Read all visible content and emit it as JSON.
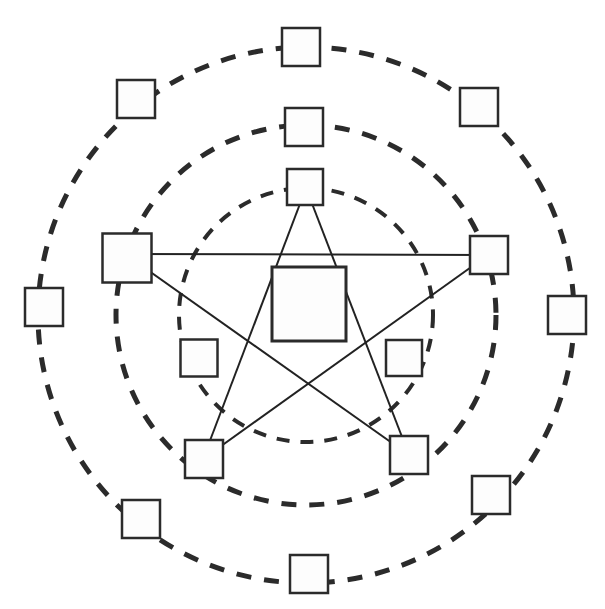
{
  "diagram": {
    "type": "node-link-diagram",
    "canvas": {
      "width": 605,
      "height": 609,
      "background": "#ffffff"
    },
    "center": {
      "x": 306,
      "y": 315
    },
    "colors": {
      "stroke": "#1a1a1a",
      "ring_stroke": "#2b2b2b",
      "node_fill": "#fdfdfd",
      "node_stroke": "#2b2b2b",
      "star_stroke": "#222222",
      "background": "#ffffff"
    },
    "rings": [
      {
        "id": "outer-ring",
        "name": "outer-ring",
        "radius": 268,
        "stroke_width": 5,
        "dash_pattern": "15 13",
        "node_count": 10,
        "node_size": 38,
        "start_angle_deg": -90,
        "style": "dashed"
      },
      {
        "id": "middle-ring",
        "name": "middle-ring",
        "radius": 190,
        "stroke_width": 5,
        "dash_pattern": "15 13",
        "node_count": 5,
        "node_size": 38,
        "start_angle_deg": -90,
        "style": "dashed"
      },
      {
        "id": "inner-ring",
        "name": "inner-ring",
        "radius": 127,
        "stroke_width": 4,
        "dash_pattern": "13 11",
        "node_count": 3,
        "node_size": 36,
        "start_angle_deg": -90,
        "style": "dashed"
      }
    ],
    "center_node": {
      "id": "center-node",
      "name": "center-node",
      "x": 309,
      "y": 304,
      "size": 74,
      "stroke_width": 3
    },
    "star": {
      "id": "pentagram",
      "name": "pentagram",
      "points": 5,
      "skip": 2,
      "stroke_width": 2,
      "vertices": [
        {
          "label": "top",
          "x": 306,
          "y": 188
        },
        {
          "label": "right",
          "x": 488,
          "y": 255
        },
        {
          "label": "bottom-right",
          "x": 409,
          "y": 455
        },
        {
          "label": "bottom-left",
          "x": 203,
          "y": 459
        },
        {
          "label": "left",
          "x": 125,
          "y": 254
        }
      ],
      "edges": [
        [
          0,
          2
        ],
        [
          2,
          4
        ],
        [
          4,
          1
        ],
        [
          1,
          3
        ],
        [
          3,
          0
        ]
      ]
    },
    "nodes": [
      {
        "id": "outer-1",
        "ring": "outer-ring",
        "name": "outer-node-n",
        "cx": 301,
        "cy": 47,
        "size": 38
      },
      {
        "id": "outer-2",
        "ring": "outer-ring",
        "name": "outer-node-nne",
        "cx": 479,
        "cy": 107,
        "size": 38
      },
      {
        "id": "outer-3",
        "ring": "outer-ring",
        "name": "outer-node-ene",
        "cx": 567,
        "cy": 315,
        "size": 38
      },
      {
        "id": "outer-4",
        "ring": "outer-ring",
        "name": "outer-node-ese",
        "cx": 491,
        "cy": 495,
        "size": 38
      },
      {
        "id": "outer-5",
        "ring": "outer-ring",
        "name": "outer-node-sse",
        "cx": 309,
        "cy": 574,
        "size": 38
      },
      {
        "id": "outer-6",
        "ring": "outer-ring",
        "name": "outer-node-ssw",
        "cx": 141,
        "cy": 519,
        "size": 38
      },
      {
        "id": "outer-7",
        "ring": "outer-ring",
        "name": "outer-node-wsw",
        "cx": 44,
        "cy": 307,
        "size": 38
      },
      {
        "id": "outer-8",
        "ring": "outer-ring",
        "name": "outer-node-wnw",
        "cx": 136,
        "cy": 99,
        "size": 38
      },
      {
        "id": "mid-1",
        "ring": "middle-ring",
        "name": "mid-node-top",
        "cx": 304,
        "cy": 127,
        "size": 38
      },
      {
        "id": "mid-2",
        "ring": "middle-ring",
        "name": "mid-node-right",
        "cx": 489,
        "cy": 255,
        "size": 38
      },
      {
        "id": "mid-3",
        "ring": "middle-ring",
        "name": "mid-node-br",
        "cx": 409,
        "cy": 455,
        "size": 38
      },
      {
        "id": "mid-4",
        "ring": "middle-ring",
        "name": "mid-node-bl",
        "cx": 204,
        "cy": 459,
        "size": 38
      },
      {
        "id": "mid-5",
        "ring": "middle-ring",
        "name": "mid-node-left",
        "cx": 127,
        "cy": 258,
        "size": 49
      },
      {
        "id": "inner-1",
        "ring": "inner-ring",
        "name": "inner-node-top",
        "cx": 305,
        "cy": 187,
        "size": 36
      },
      {
        "id": "inner-2",
        "ring": "inner-ring",
        "name": "inner-node-br",
        "cx": 404,
        "cy": 358,
        "size": 36
      },
      {
        "id": "inner-3",
        "ring": "inner-ring",
        "name": "inner-node-bl",
        "cx": 199,
        "cy": 358,
        "size": 37
      }
    ],
    "legend": {
      "ring_label_outer": "outer-ring",
      "ring_label_middle": "middle-ring",
      "ring_label_inner": "inner-ring",
      "center_label": "center-node"
    }
  }
}
